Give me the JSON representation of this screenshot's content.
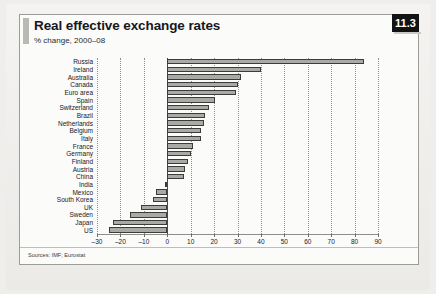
{
  "panel": {
    "title": "Real effective exchange rates",
    "subtitle": "% change, 2000–08",
    "badge": "11.3",
    "source": "Sources: IMF; Eurostat",
    "bar_fill": "#a9a9a6",
    "bar_stroke": "#3c3c3a",
    "badge_bg": "#111214",
    "badge_fg": "#ffffff"
  },
  "chart_data": {
    "type": "bar",
    "orientation": "horizontal",
    "title": "Real effective exchange rates",
    "subtitle": "% change, 2000–08",
    "xlabel": "",
    "ylabel": "",
    "xlim": [
      -30,
      90
    ],
    "xticks": [
      -30,
      -20,
      -10,
      0,
      10,
      20,
      30,
      40,
      50,
      60,
      70,
      80,
      90
    ],
    "xticklabels": [
      "–30",
      "–20",
      "–10",
      "0",
      "10",
      "20",
      "30",
      "40",
      "50",
      "60",
      "70",
      "80",
      "90"
    ],
    "grid": true,
    "grid_style": "dotted-vertical",
    "legend": null,
    "categories": [
      "Russia",
      "Ireland",
      "Australia",
      "Canada",
      "Euro area",
      "Spain",
      "Switzerland",
      "Brazil",
      "Netherlands",
      "Belgium",
      "Italy",
      "France",
      "Germany",
      "Finland",
      "Austria",
      "China",
      "India",
      "Mexico",
      "South Korea",
      "UK",
      "Sweden",
      "Japan",
      "US"
    ],
    "values": [
      84,
      40,
      31.5,
      30,
      29.5,
      20.5,
      18,
      16,
      15.5,
      14.5,
      14.5,
      11,
      10,
      9,
      7.5,
      7,
      -1,
      -5,
      -6,
      -11,
      -16,
      -23,
      -25
    ],
    "source": "Sources: IMF; Eurostat"
  }
}
